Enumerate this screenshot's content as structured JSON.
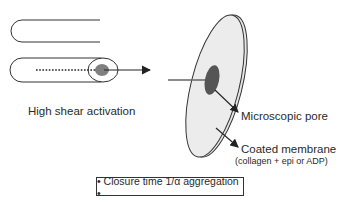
{
  "diagram": {
    "labels": {
      "activation": "High shear activation",
      "pore": "Microscopic pore",
      "membrane": "Coated membrane",
      "membrane_detail": "(collagen + epi or ADP)"
    },
    "summary_box": "• Closure time 1/α aggregation •",
    "colors": {
      "line": "#222222",
      "disk_fill": "#e6e6e6",
      "pore_fill": "#555555",
      "tube_tip_fill": "#808080"
    }
  }
}
